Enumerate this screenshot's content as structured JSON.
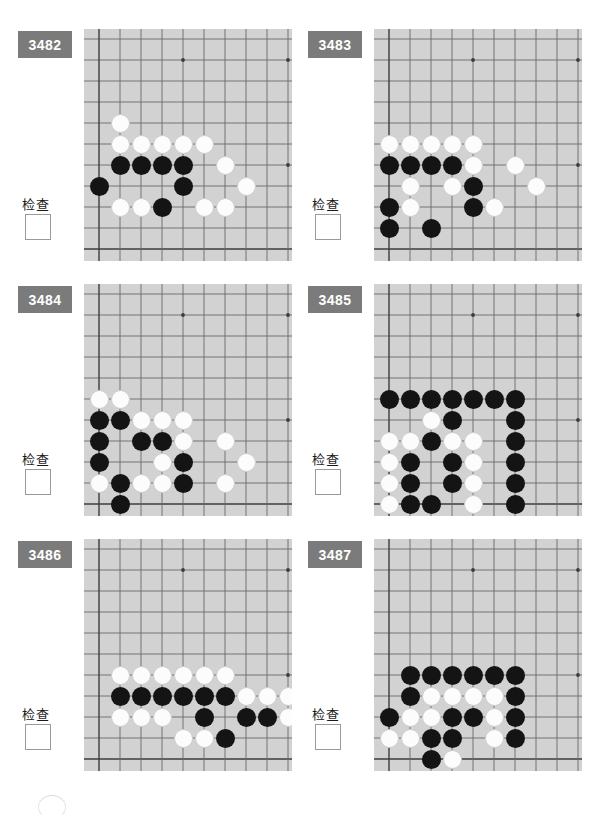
{
  "page": {
    "badge_color": "#7b7b7b",
    "board_color": "#d2d2d2",
    "black_color": "#141414",
    "white_color": "#fcfcfc",
    "columns": 2,
    "rows": 3
  },
  "labels": {
    "check": "检查",
    "checkbox_value": ""
  },
  "board_spec": {
    "cols": 10,
    "rows": 11,
    "spacing": 21,
    "origin_x": 15,
    "origin_y": 10,
    "star_points": [
      [
        4,
        1
      ],
      [
        9,
        1
      ],
      [
        9,
        6
      ]
    ],
    "left_edge_col": 0,
    "bottom_edge_row": 10
  },
  "puzzles": [
    {
      "id": "3482",
      "number": "3482",
      "check_label": "检查",
      "black": [
        [
          1,
          6
        ],
        [
          2,
          6
        ],
        [
          3,
          6
        ],
        [
          4,
          6
        ],
        [
          0,
          7
        ],
        [
          4,
          7
        ],
        [
          3,
          8
        ]
      ],
      "white": [
        [
          1,
          4
        ],
        [
          1,
          5
        ],
        [
          2,
          5
        ],
        [
          3,
          5
        ],
        [
          4,
          5
        ],
        [
          5,
          5
        ],
        [
          6,
          6
        ],
        [
          7,
          7
        ],
        [
          1,
          8
        ],
        [
          2,
          8
        ],
        [
          5,
          8
        ],
        [
          6,
          8
        ]
      ]
    },
    {
      "id": "3483",
      "number": "3483",
      "check_label": "检查",
      "black": [
        [
          0,
          6
        ],
        [
          1,
          6
        ],
        [
          2,
          6
        ],
        [
          3,
          6
        ],
        [
          4,
          7
        ],
        [
          0,
          8
        ],
        [
          4,
          8
        ],
        [
          0,
          9
        ],
        [
          2,
          9
        ]
      ],
      "white": [
        [
          0,
          5
        ],
        [
          1,
          5
        ],
        [
          2,
          5
        ],
        [
          3,
          5
        ],
        [
          4,
          5
        ],
        [
          4,
          6
        ],
        [
          6,
          6
        ],
        [
          1,
          7
        ],
        [
          3,
          7
        ],
        [
          7,
          7
        ],
        [
          1,
          8
        ],
        [
          5,
          8
        ]
      ]
    },
    {
      "id": "3484",
      "number": "3484",
      "check_label": "检查",
      "black": [
        [
          0,
          6
        ],
        [
          1,
          6
        ],
        [
          0,
          7
        ],
        [
          2,
          7
        ],
        [
          3,
          7
        ],
        [
          0,
          8
        ],
        [
          4,
          8
        ],
        [
          1,
          9
        ],
        [
          4,
          9
        ],
        [
          1,
          10
        ]
      ],
      "white": [
        [
          0,
          5
        ],
        [
          1,
          5
        ],
        [
          2,
          6
        ],
        [
          3,
          6
        ],
        [
          4,
          6
        ],
        [
          4,
          7
        ],
        [
          6,
          7
        ],
        [
          3,
          8
        ],
        [
          7,
          8
        ],
        [
          0,
          9
        ],
        [
          2,
          9
        ],
        [
          3,
          9
        ],
        [
          6,
          9
        ]
      ]
    },
    {
      "id": "3485",
      "number": "3485",
      "check_label": "检查",
      "black": [
        [
          0,
          5
        ],
        [
          1,
          5
        ],
        [
          2,
          5
        ],
        [
          3,
          5
        ],
        [
          4,
          5
        ],
        [
          5,
          5
        ],
        [
          6,
          5
        ],
        [
          3,
          6
        ],
        [
          6,
          6
        ],
        [
          2,
          7
        ],
        [
          6,
          7
        ],
        [
          1,
          8
        ],
        [
          3,
          8
        ],
        [
          6,
          8
        ],
        [
          1,
          9
        ],
        [
          3,
          9
        ],
        [
          6,
          9
        ],
        [
          1,
          10
        ],
        [
          2,
          10
        ],
        [
          6,
          10
        ],
        [
          4,
          11
        ],
        [
          6,
          11
        ]
      ],
      "white": [
        [
          2,
          6
        ],
        [
          0,
          7
        ],
        [
          1,
          7
        ],
        [
          3,
          7
        ],
        [
          4,
          7
        ],
        [
          0,
          8
        ],
        [
          4,
          8
        ],
        [
          0,
          9
        ],
        [
          4,
          9
        ],
        [
          0,
          10
        ],
        [
          4,
          10
        ],
        [
          1,
          11
        ],
        [
          2,
          11
        ],
        [
          3,
          11
        ]
      ]
    },
    {
      "id": "3486",
      "number": "3486",
      "check_label": "检查",
      "black": [
        [
          1,
          7
        ],
        [
          2,
          7
        ],
        [
          3,
          7
        ],
        [
          4,
          7
        ],
        [
          5,
          7
        ],
        [
          6,
          7
        ],
        [
          5,
          8
        ],
        [
          7,
          8
        ],
        [
          8,
          8
        ],
        [
          6,
          9
        ]
      ],
      "white": [
        [
          1,
          6
        ],
        [
          2,
          6
        ],
        [
          3,
          6
        ],
        [
          4,
          6
        ],
        [
          5,
          6
        ],
        [
          6,
          6
        ],
        [
          7,
          7
        ],
        [
          8,
          7
        ],
        [
          9,
          7
        ],
        [
          1,
          8
        ],
        [
          2,
          8
        ],
        [
          3,
          8
        ],
        [
          9,
          8
        ],
        [
          4,
          9
        ],
        [
          5,
          9
        ]
      ]
    },
    {
      "id": "3487",
      "number": "3487",
      "check_label": "检查",
      "black": [
        [
          1,
          6
        ],
        [
          2,
          6
        ],
        [
          3,
          6
        ],
        [
          4,
          6
        ],
        [
          5,
          6
        ],
        [
          6,
          6
        ],
        [
          1,
          7
        ],
        [
          6,
          7
        ],
        [
          0,
          8
        ],
        [
          3,
          8
        ],
        [
          4,
          8
        ],
        [
          6,
          8
        ],
        [
          2,
          9
        ],
        [
          3,
          9
        ],
        [
          6,
          9
        ],
        [
          10,
          9
        ],
        [
          2,
          10
        ]
      ],
      "white": [
        [
          2,
          7
        ],
        [
          3,
          7
        ],
        [
          4,
          7
        ],
        [
          5,
          7
        ],
        [
          1,
          8
        ],
        [
          2,
          8
        ],
        [
          5,
          8
        ],
        [
          0,
          9
        ],
        [
          1,
          9
        ],
        [
          5,
          9
        ],
        [
          3,
          10
        ]
      ]
    }
  ]
}
